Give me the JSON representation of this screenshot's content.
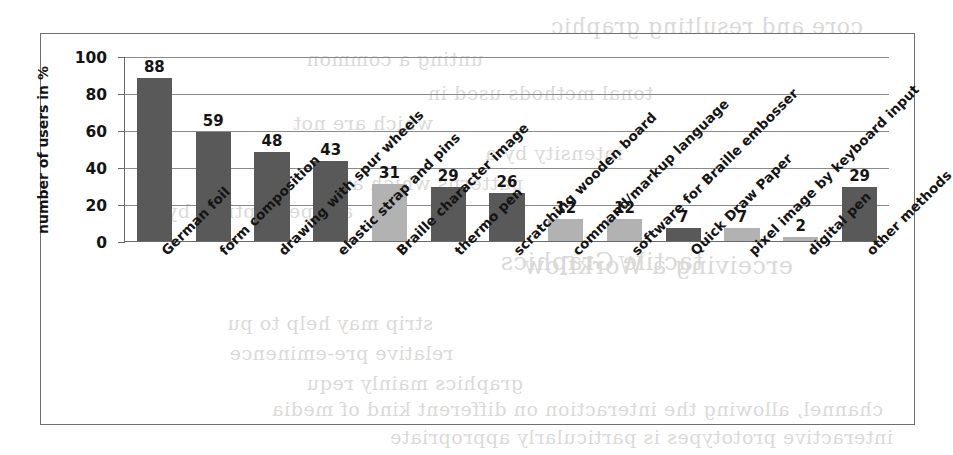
{
  "chart_data": {
    "type": "bar",
    "title": "",
    "xlabel": "",
    "ylabel": "number of users in %",
    "ylim": [
      0,
      100
    ],
    "yticks": [
      0,
      20,
      40,
      60,
      80,
      100
    ],
    "grid": true,
    "legend": null,
    "categories": [
      "German foil",
      "form composition",
      "drawing with spur wheels",
      "elastic strap and pins",
      "Braille character image",
      "thermo pen",
      "scratching wooden board",
      "command/markup language",
      "software for Braille embosser",
      "Quick Draw Paper",
      "pixel image by keyboard input",
      "digital pen",
      "other methods"
    ],
    "values": [
      88,
      59,
      48,
      43,
      31,
      29,
      26,
      12,
      12,
      7,
      7,
      2,
      29
    ],
    "bar_shades": [
      "dark",
      "dark",
      "dark",
      "dark",
      "light",
      "dark",
      "dark",
      "light",
      "light",
      "dark",
      "light",
      "light",
      "dark"
    ],
    "colors": {
      "bar_dark": "#595959",
      "bar_light": "#b2b2b2",
      "axis": "#6a6a6a",
      "gridline": "#8a8a8a",
      "frame": "#6f6f6f",
      "text": "#141414",
      "background": "#ffffff"
    }
  },
  "background_bleed": {
    "note": "faint mirrored show-through text from reverse of scanned page",
    "lines": [
      "core and resulting graphic",
      "unting a common",
      "tonal methods used in",
      "which are not",
      "intensity by a",
      "patterns which are",
      "are perceptible by",
      "tactile Graphics",
      "erceiving a Workflow",
      "strip may help to pu",
      "relative pre-eminence",
      "graphics mainly requ",
      "channel, allowing the interaction on different kind of media",
      "interactive prototypes is particularly appropriate"
    ]
  }
}
